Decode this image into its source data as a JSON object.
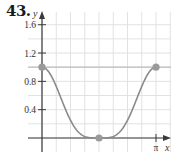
{
  "problem_number": "43.",
  "chart_data": {
    "type": "line",
    "title": "",
    "xlabel": "x",
    "ylabel": "y",
    "xlim": [
      0,
      3.1416
    ],
    "ylim": [
      0,
      1.6
    ],
    "x_tick_labels": [
      "π"
    ],
    "y_tick_labels": [
      "0.4",
      "0.8",
      "1.2",
      "1.6"
    ],
    "y_ticks": [
      0.4,
      0.8,
      1.2,
      1.6
    ],
    "grid": true,
    "reference_line": {
      "y": 1.0,
      "label": ""
    },
    "series": [
      {
        "name": "curve",
        "function": "cos^4(x)",
        "x": [
          0,
          0.3927,
          0.7854,
          1.1781,
          1.5708,
          1.9635,
          2.3562,
          2.7489,
          3.1416
        ],
        "y": [
          1.0,
          0.73,
          0.25,
          0.02,
          0.0,
          0.02,
          0.25,
          0.73,
          1.0
        ]
      }
    ],
    "highlighted_points": [
      {
        "x": 0,
        "y": 1.0
      },
      {
        "x": 1.5708,
        "y": 0.0
      },
      {
        "x": 3.1416,
        "y": 1.0
      }
    ],
    "colors": {
      "curve": "#8a8a8a",
      "points": "#9a9a9a",
      "axes": "#3a3a3a",
      "grid": "#e2e2e2",
      "reference_line": "#bdbdbd"
    }
  }
}
